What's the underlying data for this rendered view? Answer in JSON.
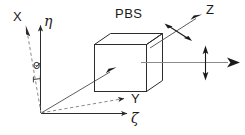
{
  "figure": {
    "background_color": "#ffffff",
    "line_color": "#2b2b2b",
    "dashed_color": "#8a8a8a",
    "beam_color": "#8a8a8a"
  },
  "labels": {
    "pbs": "PBS",
    "x_axis": "X",
    "y_axis": "Y",
    "z_axis": "Z",
    "eta_axis": "η",
    "zeta_axis": "ζ",
    "theta_angle": "Θ"
  },
  "components": {
    "beamsplitter_cube": "cube",
    "input_beam": "input-beam-arrow",
    "reflected_beam": "reflected-beam-arrow",
    "transmitted_beam": "transmitted-beam-arrow",
    "polarization_reflected": "double-headed-arrow",
    "polarization_transmitted": "double-headed-arrow"
  },
  "axes": {
    "lab_frame": [
      "X",
      "Y",
      "Z"
    ],
    "rotated_frame": [
      "η",
      "ζ"
    ],
    "rotation_angle": "Θ"
  }
}
